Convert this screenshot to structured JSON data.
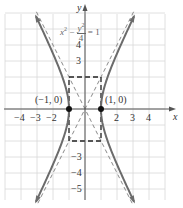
{
  "chart_data": {
    "type": "line",
    "title": "",
    "equation": "x^2 - y^2/4 = 1",
    "equation_display": {
      "x_term": "x",
      "x_exp": "2",
      "minus": "−",
      "y_num": "y",
      "y_exp": "2",
      "y_den": "4",
      "equals": "= 1"
    },
    "xlabel": "x",
    "ylabel": "y",
    "xlim": [
      -5,
      5
    ],
    "ylim": [
      -6,
      6
    ],
    "grid": true,
    "x_ticks": [
      "−4",
      "−3",
      "−2",
      "2",
      "3",
      "4"
    ],
    "x_tick_values": [
      -4,
      -3,
      -2,
      2,
      3,
      4
    ],
    "y_ticks": [
      "4",
      "3",
      "−3",
      "−4",
      "−5"
    ],
    "y_tick_values": [
      4,
      3,
      -3,
      -4,
      -5
    ],
    "series": [
      {
        "name": "hyperbola right branch",
        "style": "solid",
        "description": "x = sqrt(1 + y^2/4), x>0"
      },
      {
        "name": "hyperbola left branch",
        "style": "solid",
        "description": "x = -sqrt(1 + y^2/4), x<0"
      },
      {
        "name": "asymptote y = 2x",
        "style": "dashed"
      },
      {
        "name": "asymptote y = -2x",
        "style": "dashed"
      },
      {
        "name": "fundamental rectangle",
        "style": "dashed",
        "corners": [
          [
            -1,
            2
          ],
          [
            1,
            2
          ],
          [
            1,
            -2
          ],
          [
            -1,
            -2
          ]
        ]
      }
    ],
    "points": [
      {
        "label": "(−1, 0)",
        "x": -1,
        "y": 0
      },
      {
        "label": "(1, 0)",
        "x": 1,
        "y": 0
      }
    ]
  },
  "colors": {
    "grid": "#d8d8d8",
    "axis": "#555555",
    "curve": "#6b6b6b",
    "asymptote": "#8a8a8a",
    "rect": "#222222",
    "point": "#111111",
    "text": "#333333"
  }
}
